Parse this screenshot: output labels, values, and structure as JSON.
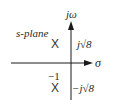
{
  "diagram": {
    "title": "s-plane",
    "type": "pole-zero plot",
    "axes": {
      "imaginary": {
        "label": "jω"
      },
      "real": {
        "label": "σ"
      }
    },
    "poles": [
      {
        "symbol": "X",
        "real": -1,
        "imag_label": "j√8"
      },
      {
        "symbol": "X",
        "real": -1,
        "imag_label": "−j√8"
      }
    ],
    "annotations": {
      "real_part": "−1"
    },
    "colors": {
      "axis": "#1a1a1a",
      "text": "#2a2a2a",
      "background": "#ffffff"
    }
  }
}
